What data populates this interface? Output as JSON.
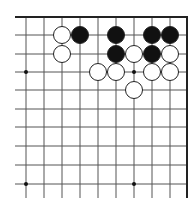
{
  "board": {
    "description": "Go board corner diagram (top-right corner)",
    "background": "#ffffff",
    "line_color": "#555555",
    "border_color": "#222222",
    "columns_x": [
      26,
      44,
      62,
      80,
      98,
      116,
      134,
      152,
      170
    ],
    "right_border_x": 187,
    "top_border_y": 17,
    "rows_y": [
      35,
      54,
      72,
      90,
      109,
      127,
      146,
      165,
      184
    ],
    "line_left_x": 15,
    "line_bottom_y": 198,
    "stone_radius": 8.5,
    "star_points": [
      {
        "x": 26,
        "y": 72
      },
      {
        "x": 134,
        "y": 72
      },
      {
        "x": 26,
        "y": 184
      },
      {
        "x": 134,
        "y": 184
      }
    ],
    "stones": [
      {
        "color": "white",
        "x": 62,
        "y": 35
      },
      {
        "color": "black",
        "x": 80,
        "y": 35
      },
      {
        "color": "black",
        "x": 116,
        "y": 35
      },
      {
        "color": "black",
        "x": 152,
        "y": 35
      },
      {
        "color": "black",
        "x": 170,
        "y": 35
      },
      {
        "color": "white",
        "x": 62,
        "y": 54
      },
      {
        "color": "black",
        "x": 116,
        "y": 54
      },
      {
        "color": "white",
        "x": 134,
        "y": 54
      },
      {
        "color": "black",
        "x": 152,
        "y": 54
      },
      {
        "color": "white",
        "x": 170,
        "y": 54
      },
      {
        "color": "white",
        "x": 98,
        "y": 72
      },
      {
        "color": "white",
        "x": 116,
        "y": 72
      },
      {
        "color": "white",
        "x": 152,
        "y": 72
      },
      {
        "color": "white",
        "x": 170,
        "y": 72
      },
      {
        "color": "white",
        "x": 134,
        "y": 90
      }
    ],
    "stone_colors": {
      "black": "#111111",
      "white": "#ffffff",
      "outline": "#222222"
    }
  }
}
